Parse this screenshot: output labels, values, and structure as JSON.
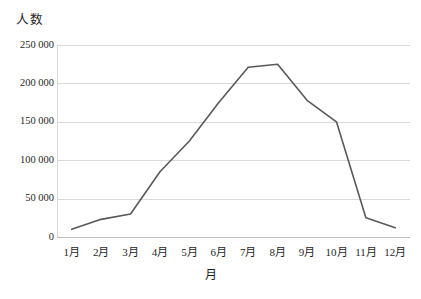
{
  "chart_data": {
    "type": "line",
    "title": "",
    "xlabel": "月",
    "ylabel": "人数",
    "categories": [
      "1月",
      "2月",
      "3月",
      "4月",
      "5月",
      "6月",
      "7月",
      "8月",
      "9月",
      "10月",
      "11月",
      "12月"
    ],
    "values": [
      10000,
      23000,
      30000,
      85000,
      125000,
      175000,
      221000,
      225000,
      178000,
      150000,
      25000,
      12000
    ],
    "series": [
      {
        "name": "人数",
        "values": [
          10000,
          23000,
          30000,
          85000,
          125000,
          175000,
          221000,
          225000,
          178000,
          150000,
          25000,
          12000
        ]
      }
    ],
    "ylim": [
      0,
      250000
    ],
    "y_ticks": [
      0,
      50000,
      100000,
      150000,
      200000,
      250000
    ],
    "y_tick_labels": [
      "0",
      "50 000",
      "100 000",
      "150 000",
      "200 000",
      "250 000"
    ],
    "grid": "horizontal",
    "legend": "none",
    "line_color": "#595959",
    "grid_color": "#d9d9d9",
    "background_color": "#ffffff"
  }
}
